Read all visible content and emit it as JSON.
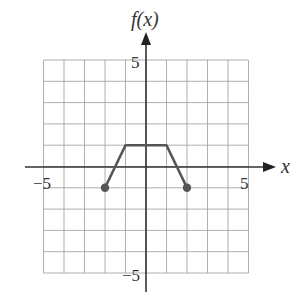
{
  "chart_data": {
    "type": "line",
    "title": "",
    "xlabel": "x",
    "ylabel": "f(x)",
    "xlim": [
      -5,
      5
    ],
    "ylim": [
      -5,
      5
    ],
    "grid": true,
    "x_tick_labels": [
      "-5",
      "5"
    ],
    "y_tick_labels": [
      "5",
      "-5"
    ],
    "series": [
      {
        "name": "f(x)",
        "x": [
          -2,
          -1,
          1,
          2
        ],
        "y": [
          -1,
          1,
          1,
          -1
        ],
        "endpoints": "closed",
        "color": "#555555"
      }
    ]
  },
  "labels": {
    "y_axis": "f(x)",
    "x_axis": "x",
    "x_min": "−5",
    "x_max": "5",
    "y_max": "5",
    "y_min": "−5"
  }
}
